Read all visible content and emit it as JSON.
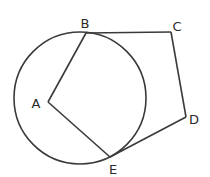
{
  "diagram": {
    "type": "geometry",
    "circle": {
      "center_label": "A",
      "cx": 80,
      "cy": 98,
      "r": 66
    },
    "points": {
      "A": {
        "label": "A",
        "x": 48,
        "y": 102,
        "lx": 40,
        "ly": 108
      },
      "B": {
        "label": "B",
        "x": 86,
        "y": 33,
        "lx": 85,
        "ly": 28
      },
      "C": {
        "label": "C",
        "x": 171,
        "y": 32,
        "lx": 177,
        "ly": 31
      },
      "D": {
        "label": "D",
        "x": 186,
        "y": 117,
        "lx": 194,
        "ly": 124
      },
      "E": {
        "label": "E",
        "x": 110,
        "y": 157,
        "lx": 113,
        "ly": 174
      }
    },
    "segments": [
      [
        "A",
        "B"
      ],
      [
        "A",
        "E"
      ],
      [
        "B",
        "C"
      ],
      [
        "C",
        "D"
      ],
      [
        "D",
        "E"
      ]
    ]
  }
}
